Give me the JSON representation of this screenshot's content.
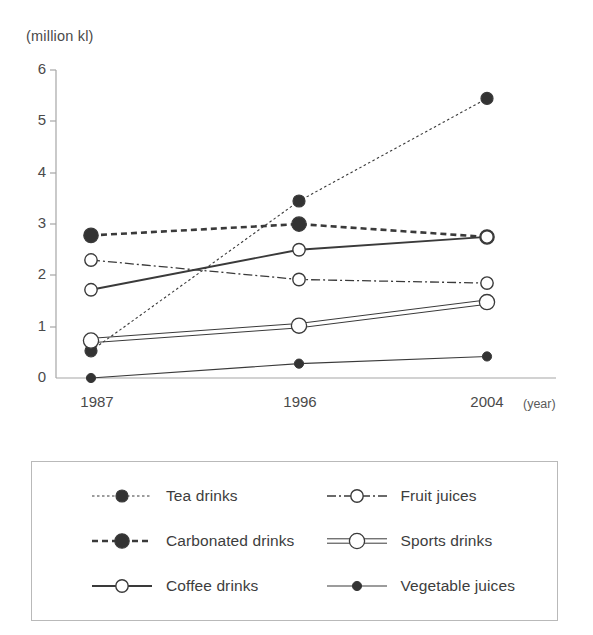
{
  "axis": {
    "unit_label": "(million kl)",
    "x_axis_title": "(year)",
    "y_ticks": [
      "6",
      "5",
      "4",
      "3",
      "2",
      "1",
      "0"
    ],
    "x_ticks": [
      "1987",
      "1996",
      "2004"
    ]
  },
  "colors": {
    "line": "#3a3a3a",
    "axis": "#9a9a9a",
    "marker_fill": "#333333",
    "marker_open": "#ffffff",
    "legend_border": "#b9b9b9",
    "text": "#3a3a3a"
  },
  "legend": {
    "items": [
      {
        "label": "Tea drinks",
        "style": "fine-dotted",
        "marker": "filled-circle",
        "column": 1,
        "row": 1
      },
      {
        "label": "Carbonated drinks",
        "style": "bold-dashed",
        "marker": "large-filled-circle",
        "column": 1,
        "row": 2
      },
      {
        "label": "Coffee drinks",
        "style": "solid",
        "marker": "open-circle",
        "column": 1,
        "row": 3
      },
      {
        "label": "Fruit juices",
        "style": "dash-dot",
        "marker": "open-circle",
        "column": 2,
        "row": 1
      },
      {
        "label": "Sports drinks",
        "style": "double-line",
        "marker": "large-open-circle",
        "column": 2,
        "row": 2
      },
      {
        "label": "Vegetable juices",
        "style": "thin-solid",
        "marker": "small-filled-circle",
        "column": 2,
        "row": 3
      }
    ]
  },
  "chart_data": {
    "type": "line",
    "title": "",
    "xlabel": "(year)",
    "ylabel": "(million kl)",
    "x": [
      "1987",
      "1996",
      "2004"
    ],
    "categories": [
      "1987",
      "1996",
      "2004"
    ],
    "ylim": [
      0,
      6
    ],
    "yticks": [
      0,
      1,
      2,
      3,
      4,
      5,
      6
    ],
    "grid": false,
    "legend_position": "below",
    "series": [
      {
        "name": "Tea drinks",
        "values": [
          0.53,
          3.45,
          5.45
        ],
        "style": "fine-dotted",
        "marker": "filled-circle"
      },
      {
        "name": "Carbonated drinks",
        "values": [
          2.78,
          3.0,
          2.75
        ],
        "style": "bold-dashed",
        "marker": "large-filled-circle"
      },
      {
        "name": "Coffee drinks",
        "values": [
          1.72,
          2.5,
          2.75
        ],
        "style": "solid",
        "marker": "open-circle"
      },
      {
        "name": "Fruit juices",
        "values": [
          2.3,
          1.92,
          1.85
        ],
        "style": "dash-dot",
        "marker": "open-circle"
      },
      {
        "name": "Sports drinks",
        "values": [
          0.73,
          1.02,
          1.48
        ],
        "style": "double-line",
        "marker": "large-open-circle"
      },
      {
        "name": "Vegetable juices",
        "values": [
          0.0,
          0.28,
          0.42
        ],
        "style": "thin-solid",
        "marker": "small-filled-circle"
      }
    ]
  }
}
